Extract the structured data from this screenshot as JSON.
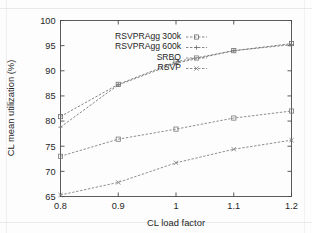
{
  "chart_data": {
    "type": "line",
    "title": "",
    "xlabel": "CL load factor",
    "ylabel": "CL mean utilization (%)",
    "x": [
      0.8,
      0.9,
      1.0,
      1.1,
      1.2
    ],
    "xtick_labels": [
      "0.8",
      "0.9",
      "1",
      "1.1",
      "1.2"
    ],
    "ytick_labels": [
      "65",
      "70",
      "75",
      "80",
      "85",
      "90",
      "95",
      "100"
    ],
    "ytick_values": [
      65,
      70,
      75,
      80,
      85,
      90,
      95,
      100
    ],
    "xlim": [
      0.8,
      1.2
    ],
    "ylim": [
      65,
      100
    ],
    "grid": false,
    "legend_position": "top-left-inside",
    "series": [
      {
        "name": "RSVPRAgg 300k",
        "values": [
          80.9,
          87.3,
          91.8,
          94.0,
          95.4
        ],
        "color": "#6f6f6f",
        "marker": "open-square",
        "dash": "2.4 1.6"
      },
      {
        "name": "RSVPRAgg 600k",
        "values": [
          78.8,
          87.2,
          91.5,
          94.0,
          95.2
        ],
        "color": "#6f6f6f",
        "marker": "plus",
        "dash": "2.4 1.6"
      },
      {
        "name": "SRBQ",
        "values": [
          73.0,
          76.4,
          78.4,
          80.6,
          82.0
        ],
        "color": "#7a7a7a",
        "marker": "open-square",
        "dash": "2.4 1.6"
      },
      {
        "name": "RSVP",
        "values": [
          65.3,
          67.8,
          71.7,
          74.4,
          76.2
        ],
        "color": "#7a7a7a",
        "marker": "cross",
        "dash": "2.4 1.6"
      }
    ]
  },
  "axes": {
    "x_title": "CL load factor",
    "y_title": "CL mean utilization (%)"
  },
  "legend": {
    "entries": [
      {
        "label": "RSVPRAgg 300k"
      },
      {
        "label": "RSVPRAgg 600k"
      },
      {
        "label": "SRBQ"
      },
      {
        "label": "RSVP"
      }
    ]
  },
  "colors": {
    "axis": "#4a4a4a",
    "text": "#252525",
    "background": "#fdfdfd",
    "series": "#6f6f6f"
  }
}
